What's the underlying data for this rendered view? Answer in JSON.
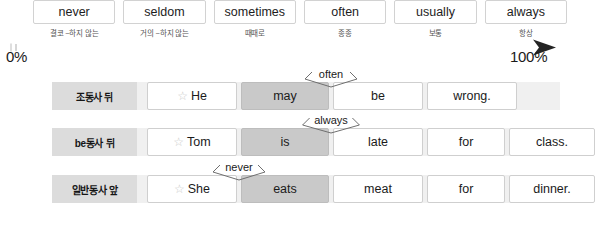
{
  "frequency_scale": {
    "words": [
      {
        "en": "never",
        "ko": "결코 ~하지 않는"
      },
      {
        "en": "seldom",
        "ko": "거의 ~하지 않는"
      },
      {
        "en": "sometimes",
        "ko": "때때로"
      },
      {
        "en": "often",
        "ko": "종종"
      },
      {
        "en": "usually",
        "ko": "보통"
      },
      {
        "en": "always",
        "ko": "항상"
      }
    ],
    "axis": {
      "start_label": "0%",
      "end_label": "100%",
      "start_color": "#d9d9d9",
      "end_color": "#2b2b2b"
    }
  },
  "rows": [
    {
      "rule_label": "조동사 뒤",
      "adverb": "often",
      "cells": [
        {
          "text": "He",
          "star": true,
          "filled": false,
          "width": 90
        },
        {
          "text": "may",
          "star": false,
          "filled": true,
          "width": 88
        },
        {
          "text": "be",
          "star": false,
          "filled": false,
          "width": 90
        },
        {
          "text": "wrong.",
          "star": false,
          "filled": false,
          "width": 90
        }
      ]
    },
    {
      "rule_label": "be동사 뒤",
      "adverb": "always",
      "cells": [
        {
          "text": "Tom",
          "star": true,
          "filled": false,
          "width": 90
        },
        {
          "text": "is",
          "star": false,
          "filled": true,
          "width": 88
        },
        {
          "text": "late",
          "star": false,
          "filled": false,
          "width": 90
        },
        {
          "text": "for",
          "star": false,
          "filled": false,
          "width": 78
        },
        {
          "text": "class.",
          "star": false,
          "filled": false,
          "width": 86
        }
      ]
    },
    {
      "rule_label": "일반동사 앞",
      "adverb": "never",
      "cells": [
        {
          "text": "She",
          "star": true,
          "filled": false,
          "width": 90
        },
        {
          "text": "eats",
          "star": false,
          "filled": true,
          "width": 88
        },
        {
          "text": "meat",
          "star": false,
          "filled": false,
          "width": 90
        },
        {
          "text": "for",
          "star": false,
          "filled": false,
          "width": 78
        },
        {
          "text": "dinner.",
          "star": false,
          "filled": false,
          "width": 86
        }
      ]
    }
  ],
  "icons": {
    "star": "☆"
  }
}
